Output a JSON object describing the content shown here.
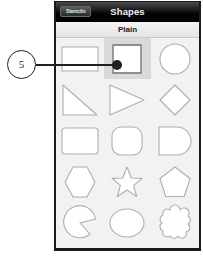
{
  "annotation": {
    "number": "5",
    "marker_color": "#231f20",
    "target": "square-shape-cell"
  },
  "device": {
    "frame_color": "#000000"
  },
  "navbar": {
    "back_label": "Stencils",
    "title": "Shapes",
    "background_color": "#000000",
    "text_color": "#f2f2f2"
  },
  "section": {
    "title": "Plain",
    "background_color": "#f0f0f0"
  },
  "grid": {
    "columns": 3,
    "rows": 5,
    "selected_index": 1,
    "shape_stroke_color": "#aeaeae",
    "selected_background_color": "#d9d9d9",
    "cells": [
      {
        "name": "rectangle",
        "label": "Rectangle",
        "selected": false
      },
      {
        "name": "square",
        "label": "Square",
        "selected": true
      },
      {
        "name": "circle",
        "label": "Circle",
        "selected": false
      },
      {
        "name": "right-triangle",
        "label": "Right Triangle",
        "selected": false
      },
      {
        "name": "triangle",
        "label": "Triangle",
        "selected": false
      },
      {
        "name": "diamond",
        "label": "Diamond",
        "selected": false
      },
      {
        "name": "rounded-rectangle",
        "label": "Rounded Rectangle",
        "selected": false
      },
      {
        "name": "rounded-square",
        "label": "Rounded Square",
        "selected": false
      },
      {
        "name": "d-shape",
        "label": "D Shape",
        "selected": false
      },
      {
        "name": "hexagon",
        "label": "Hexagon",
        "selected": false
      },
      {
        "name": "star",
        "label": "Star",
        "selected": false
      },
      {
        "name": "pentagon",
        "label": "Pentagon",
        "selected": false
      },
      {
        "name": "pac-man",
        "label": "Pac-Man",
        "selected": false
      },
      {
        "name": "ellipse",
        "label": "Ellipse",
        "selected": false
      },
      {
        "name": "cloud",
        "label": "Cloud",
        "selected": false
      }
    ]
  }
}
